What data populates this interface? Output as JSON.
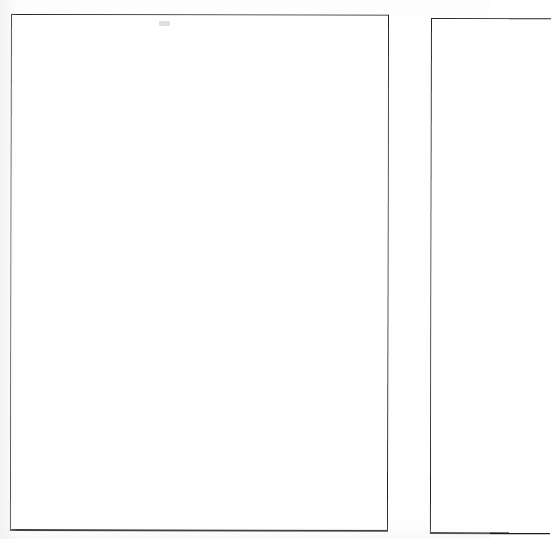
{
  "document": {
    "kind": "scanned-blank-pages",
    "page_count_visible": 2,
    "background_color": "#fefefe",
    "paper_color": "#ffffff",
    "border_color": "#242427"
  },
  "pages": [
    {
      "id": "left-page",
      "label": "",
      "content": "",
      "cropped": false,
      "border_color": "#242427"
    },
    {
      "id": "right-page",
      "label": "",
      "content": "",
      "cropped": true,
      "border_color": "#242427"
    }
  ],
  "artifacts": [
    {
      "id": "scan-artifact",
      "label": "",
      "color": "#c4c4c8"
    }
  ]
}
